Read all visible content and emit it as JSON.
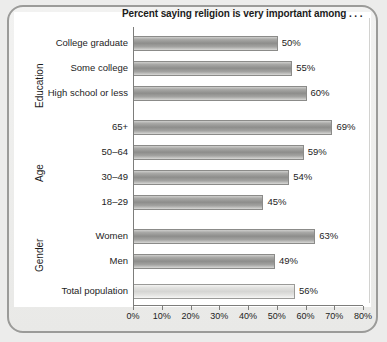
{
  "chart_data": {
    "type": "bar",
    "orientation": "horizontal",
    "title": "Percent saying religion is very important among . . .",
    "xlabel": "",
    "ylabel": "",
    "xlim": [
      0,
      80
    ],
    "xticks": [
      "0%",
      "10%",
      "20%",
      "30%",
      "40%",
      "50%",
      "60%",
      "70%",
      "80%"
    ],
    "xtick_values": [
      0,
      10,
      20,
      30,
      40,
      50,
      60,
      70,
      80
    ],
    "grid": false,
    "legend": "none",
    "value_suffix": "%",
    "groups": [
      {
        "name": "Education",
        "categories": [
          "College graduate",
          "Some college",
          "High school or less"
        ],
        "values": [
          50,
          55,
          60
        ],
        "labels": [
          "50%",
          "55%",
          "60%"
        ]
      },
      {
        "name": "Age",
        "categories": [
          "65+",
          "50–64",
          "30–49",
          "18–29"
        ],
        "values": [
          69,
          59,
          54,
          45
        ],
        "labels": [
          "69%",
          "59%",
          "54%",
          "45%"
        ]
      },
      {
        "name": "Gender",
        "categories": [
          "Women",
          "Men"
        ],
        "values": [
          63,
          49
        ],
        "labels": [
          "63%",
          "49%"
        ]
      },
      {
        "name": "",
        "categories": [
          "Total population"
        ],
        "values": [
          56
        ],
        "labels": [
          "56%"
        ],
        "highlight": true
      }
    ],
    "categories": [
      "College graduate",
      "Some college",
      "High school or less",
      "65+",
      "50–64",
      "30–49",
      "18–29",
      "Women",
      "Men",
      "Total population"
    ],
    "values": [
      50,
      55,
      60,
      69,
      59,
      54,
      45,
      63,
      49,
      56
    ],
    "colors": {
      "bar_fill": "#8d8d8b",
      "bar_fill_highlight": "#d5d5d3",
      "axis": "#7d7d7b",
      "text": "#1d1d1d",
      "panel_background": "#ffffff",
      "frame_background": "#ececea"
    }
  },
  "rows": [
    {
      "label": "College graduate",
      "value": 50,
      "text": "50%",
      "top": 36,
      "light": false
    },
    {
      "label": "Some college",
      "value": 55,
      "text": "55%",
      "top": 61,
      "light": false
    },
    {
      "label": "High school or less",
      "value": 60,
      "text": "60%",
      "top": 86,
      "light": false
    },
    {
      "label": "65+",
      "value": 69,
      "text": "69%",
      "top": 120,
      "light": false
    },
    {
      "label": "50–64",
      "value": 59,
      "text": "59%",
      "top": 145,
      "light": false
    },
    {
      "label": "30–49",
      "value": 54,
      "text": "54%",
      "top": 170,
      "light": false
    },
    {
      "label": "18–29",
      "value": 45,
      "text": "45%",
      "top": 195,
      "light": false
    },
    {
      "label": "Women",
      "value": 63,
      "text": "63%",
      "top": 229,
      "light": false
    },
    {
      "label": "Men",
      "value": 49,
      "text": "49%",
      "top": 254,
      "light": false
    },
    {
      "label": "Total population",
      "value": 56,
      "text": "56%",
      "top": 284,
      "light": true
    }
  ],
  "group_labels": [
    {
      "text": "Education",
      "left": 34,
      "top": 108
    },
    {
      "text": "Age",
      "left": 34,
      "top": 182
    },
    {
      "text": "Gender",
      "left": 34,
      "top": 272
    }
  ]
}
